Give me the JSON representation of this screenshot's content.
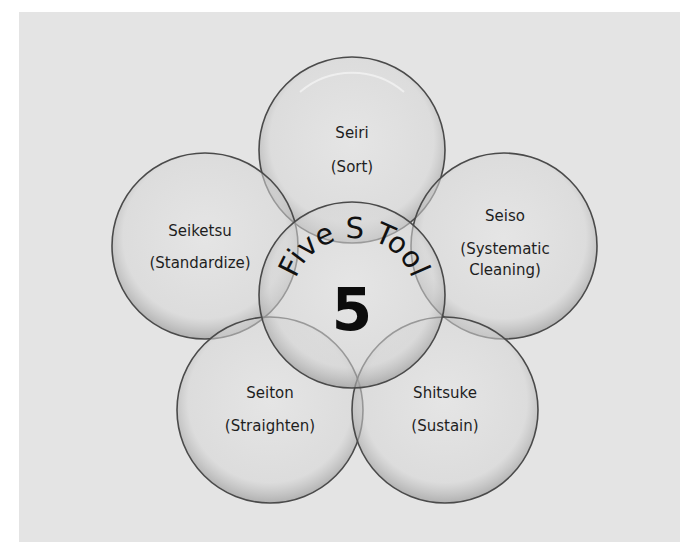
{
  "diagram": {
    "center": {
      "arc_title": "Five S Tool",
      "number": "5"
    },
    "circles": [
      {
        "id": "seiri",
        "name": "Seiri",
        "meaning": "(Sort)",
        "position": "top"
      },
      {
        "id": "seiso",
        "name": "Seiso",
        "meaning_line1": "(Systematic",
        "meaning_line2": "Cleaning)",
        "position": "right"
      },
      {
        "id": "shitsuke",
        "name": "Shitsuke",
        "meaning": "(Sustain)",
        "position": "bottom-right"
      },
      {
        "id": "seiton",
        "name": "Seiton",
        "meaning": "(Straighten)",
        "position": "bottom-left"
      },
      {
        "id": "seiketsu",
        "name": "Seiketsu",
        "meaning": "(Standardize)",
        "position": "left"
      }
    ],
    "colors": {
      "background": "#e4e4e4",
      "circle_fill": "#dcdcdc",
      "circle_stroke": "#4a4a4a",
      "text": "#1e1e1e"
    }
  }
}
